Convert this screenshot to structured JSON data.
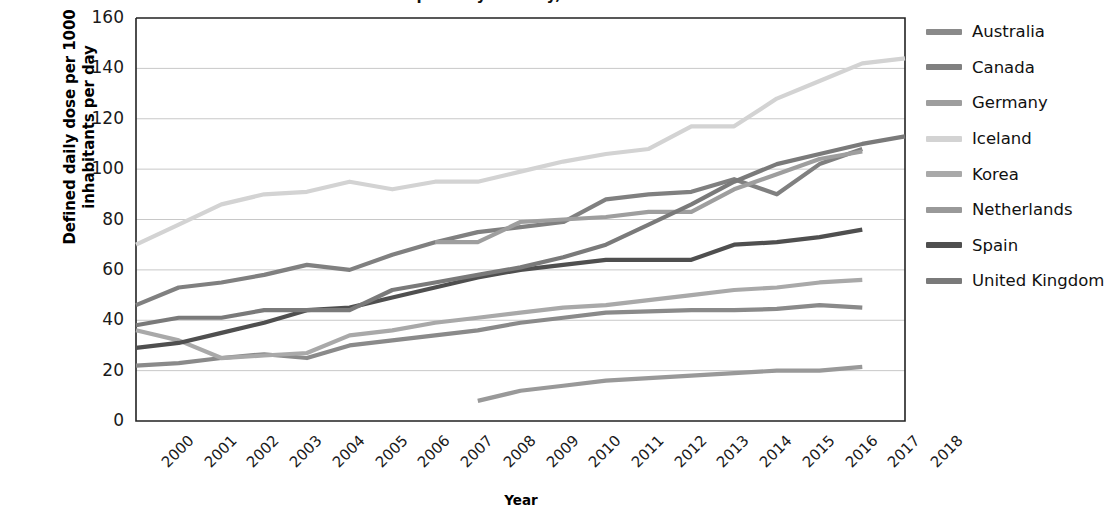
{
  "chart_data": {
    "type": "line",
    "title": "Antibiotic consumption by country, 2000-2018",
    "xlabel": "Year",
    "ylabel": "Defined daily dose per 1000 inhabitants per day",
    "ylabel_line1": "Defined daily dose per 1000",
    "ylabel_line2": "inhabitants per day",
    "x": [
      2000,
      2001,
      2002,
      2003,
      2004,
      2005,
      2006,
      2007,
      2008,
      2009,
      2010,
      2011,
      2012,
      2013,
      2014,
      2015,
      2016,
      2017,
      2018
    ],
    "categories": [
      "2000",
      "2001",
      "2002",
      "2003",
      "2004",
      "2005",
      "2006",
      "2007",
      "2008",
      "2009",
      "2010",
      "2011",
      "2012",
      "2013",
      "2014",
      "2015",
      "2016",
      "2017",
      "2018"
    ],
    "ylim": [
      0,
      160
    ],
    "yticks": [
      0,
      20,
      40,
      60,
      80,
      100,
      120,
      140,
      160
    ],
    "xlim": [
      2000,
      2018
    ],
    "grid": "horizontal",
    "legend_position": "right",
    "series": [
      {
        "name": "Australia",
        "color": "#8a8a8a",
        "x": [
          2000,
          2001,
          2002,
          2003,
          2004,
          2005,
          2006,
          2007,
          2008,
          2009,
          2010,
          2011,
          2012,
          2013,
          2014,
          2015,
          2016,
          2017
        ],
        "values": [
          22,
          23,
          25,
          26.5,
          25,
          30,
          32,
          34,
          36,
          39,
          41,
          43,
          43.5,
          44,
          44,
          44.5,
          46,
          45
        ]
      },
      {
        "name": "Canada",
        "color": "#808080",
        "x": [
          2000,
          2001,
          2002,
          2003,
          2004,
          2005,
          2006,
          2007,
          2008,
          2009,
          2010,
          2011,
          2012,
          2013,
          2014,
          2015,
          2016,
          2017
        ],
        "values": [
          46,
          53,
          55,
          58,
          62,
          60,
          66,
          71,
          75,
          77,
          79,
          88,
          90,
          91,
          96,
          90,
          102,
          108
        ]
      },
      {
        "name": "Germany",
        "color": "#9e9e9e",
        "x": [
          2007,
          2008,
          2009,
          2010,
          2011,
          2012,
          2013,
          2014,
          2015,
          2016,
          2017
        ],
        "values": [
          71,
          71,
          79,
          80,
          81,
          83,
          83,
          92,
          98,
          104,
          107
        ]
      },
      {
        "name": "Iceland",
        "color": "#d3d3d3",
        "x": [
          2000,
          2001,
          2002,
          2003,
          2004,
          2005,
          2006,
          2007,
          2008,
          2009,
          2010,
          2011,
          2012,
          2013,
          2014,
          2015,
          2016,
          2017,
          2018
        ],
        "values": [
          70,
          78,
          86,
          90,
          91,
          95,
          92,
          95,
          95,
          99,
          103,
          106,
          108,
          117,
          117,
          128,
          135,
          142,
          144
        ]
      },
      {
        "name": "Korea",
        "color": "#a9a9a9",
        "x": [
          2000,
          2001,
          2002,
          2003,
          2004,
          2005,
          2006,
          2007,
          2008,
          2009,
          2010,
          2011,
          2012,
          2013,
          2014,
          2015,
          2016,
          2017
        ],
        "values": [
          36,
          32,
          25,
          26,
          27,
          34,
          36,
          39,
          41,
          43,
          45,
          46,
          48,
          50,
          52,
          53,
          55,
          56
        ]
      },
      {
        "name": "Netherlands",
        "color": "#999999",
        "x": [
          2008,
          2009,
          2010,
          2011,
          2012,
          2013,
          2014,
          2015,
          2016,
          2017
        ],
        "values": [
          8,
          12,
          14,
          16,
          17,
          18,
          19,
          20,
          20,
          21.5
        ]
      },
      {
        "name": "Spain",
        "color": "#4f4f4f",
        "x": [
          2000,
          2001,
          2002,
          2003,
          2004,
          2005,
          2006,
          2007,
          2008,
          2009,
          2010,
          2011,
          2012,
          2013,
          2014,
          2015,
          2016,
          2017
        ],
        "values": [
          29,
          31,
          35,
          39,
          44,
          45,
          49,
          53,
          57,
          60,
          62,
          64,
          64,
          64,
          70,
          71,
          73,
          76
        ]
      },
      {
        "name": "United Kingdom",
        "color": "#7a7a7a",
        "x": [
          2000,
          2001,
          2002,
          2003,
          2004,
          2005,
          2006,
          2007,
          2008,
          2009,
          2010,
          2011,
          2012,
          2013,
          2014,
          2015,
          2016,
          2017,
          2018
        ],
        "values": [
          38,
          41,
          41,
          44,
          44,
          44,
          52,
          55,
          58,
          61,
          65,
          70,
          78,
          86,
          95,
          102,
          106,
          110,
          113
        ]
      }
    ]
  },
  "legend": {
    "items": [
      {
        "label": "Australia",
        "color": "#8a8a8a"
      },
      {
        "label": "Canada",
        "color": "#808080"
      },
      {
        "label": "Germany",
        "color": "#9e9e9e"
      },
      {
        "label": "Iceland",
        "color": "#d3d3d3"
      },
      {
        "label": "Korea",
        "color": "#a9a9a9"
      },
      {
        "label": "Netherlands",
        "color": "#999999"
      },
      {
        "label": "Spain",
        "color": "#4f4f4f"
      },
      {
        "label": "United Kingdom",
        "color": "#7a7a7a"
      }
    ]
  },
  "axes": {
    "x_title": "Year",
    "y_title_line1": "Defined daily dose per 1000",
    "y_title_line2": "inhabitants per day"
  },
  "colors": {
    "axis": "#222222",
    "gridline": "#c8c8c8",
    "background": "#ffffff"
  }
}
